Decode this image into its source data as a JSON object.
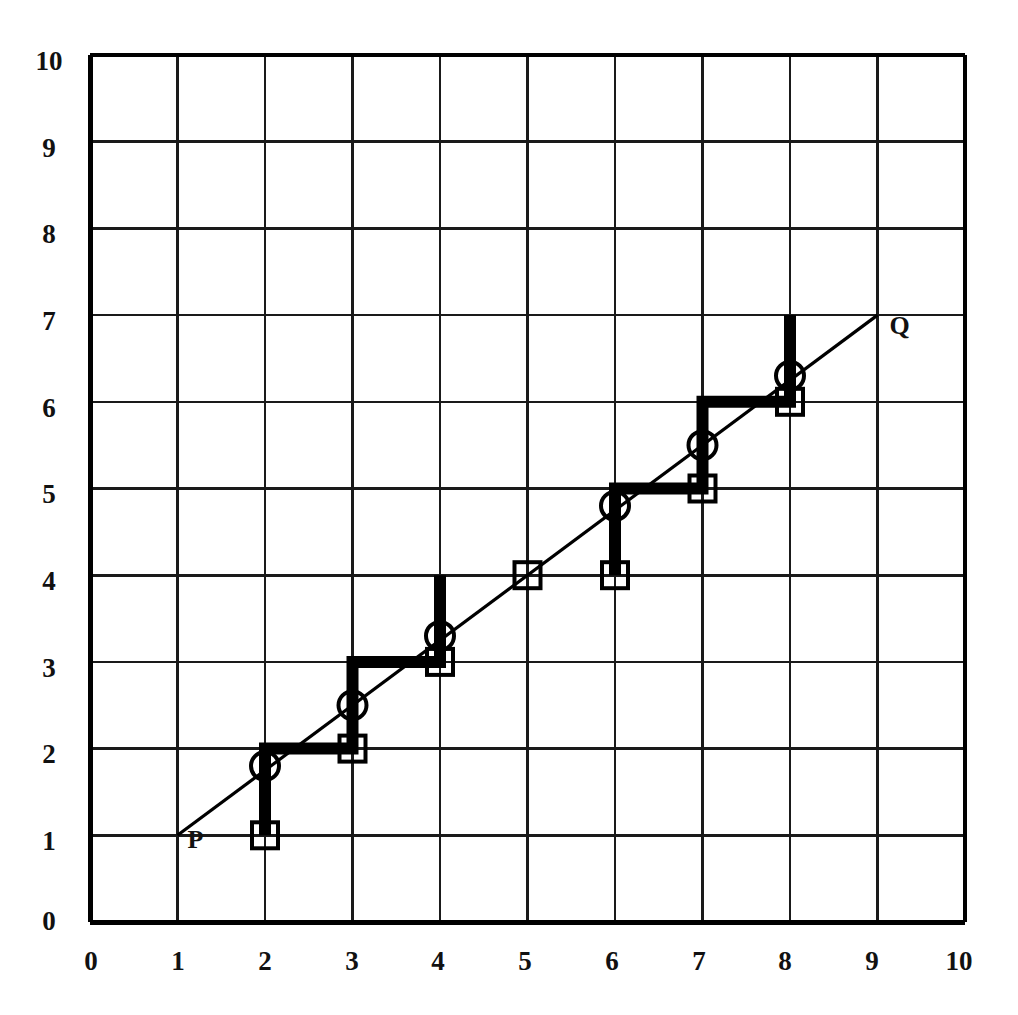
{
  "chart_data": {
    "type": "line",
    "title": "",
    "subtitle": "",
    "xlabel": "",
    "ylabel": "",
    "xlim": [
      0,
      10
    ],
    "ylim": [
      0,
      10
    ],
    "xticks": [
      "0",
      "1",
      "2",
      "3",
      "4",
      "5",
      "6",
      "7",
      "8",
      "9",
      "10"
    ],
    "yticks": [
      "0",
      "1",
      "2",
      "3",
      "4",
      "5",
      "6",
      "7",
      "8",
      "9",
      "10"
    ],
    "grid": true,
    "legend_position": "none",
    "annotations": [
      {
        "text": "P",
        "x": 1,
        "y": 1,
        "dx": 10,
        "dy": -22
      },
      {
        "text": "Q",
        "x": 9,
        "y": 7,
        "dx": 12,
        "dy": -16
      }
    ],
    "series": [
      {
        "name": "diagonal-line-PQ",
        "style": "thin-line",
        "points": [
          {
            "x": 1,
            "y": 1
          },
          {
            "x": 9,
            "y": 7
          }
        ]
      },
      {
        "name": "staircase-path",
        "style": "thick-step-line",
        "points": [
          {
            "x": 2,
            "y": 1
          },
          {
            "x": 2,
            "y": 2
          },
          {
            "x": 3,
            "y": 2
          },
          {
            "x": 3,
            "y": 3
          },
          {
            "x": 4,
            "y": 3
          },
          {
            "x": 4,
            "y": 4
          }
        ]
      },
      {
        "name": "staircase-path-upper",
        "style": "thick-step-line",
        "points": [
          {
            "x": 6,
            "y": 4
          },
          {
            "x": 6,
            "y": 5
          },
          {
            "x": 7,
            "y": 5
          },
          {
            "x": 7,
            "y": 6
          },
          {
            "x": 8,
            "y": 6
          },
          {
            "x": 8,
            "y": 7
          }
        ]
      }
    ],
    "square_markers": [
      {
        "x": 2,
        "y": 1
      },
      {
        "x": 3,
        "y": 2
      },
      {
        "x": 4,
        "y": 3
      },
      {
        "x": 5,
        "y": 4
      },
      {
        "x": 6,
        "y": 4
      },
      {
        "x": 7,
        "y": 5
      },
      {
        "x": 8,
        "y": 6
      }
    ],
    "circle_markers": [
      {
        "x": 2,
        "y": 1.8
      },
      {
        "x": 3,
        "y": 2.5
      },
      {
        "x": 4,
        "y": 3.3
      },
      {
        "x": 6,
        "y": 4.8
      },
      {
        "x": 7,
        "y": 5.5
      },
      {
        "x": 8,
        "y": 6.3
      }
    ]
  },
  "colors": {
    "background": "#ffffff",
    "grid_line": "#1a1a1a",
    "axis_line": "#000000",
    "path_line": "#000000",
    "marker_stroke": "#000000",
    "text": "#111111"
  },
  "axes": {
    "x_tick_labels": [
      "0",
      "1",
      "2",
      "3",
      "4",
      "5",
      "6",
      "7",
      "8",
      "9",
      "10"
    ],
    "y_tick_labels": [
      "0",
      "1",
      "2",
      "3",
      "4",
      "5",
      "6",
      "7",
      "8",
      "9",
      "10"
    ]
  },
  "labels": {
    "start_point": "P",
    "end_point": "Q"
  }
}
